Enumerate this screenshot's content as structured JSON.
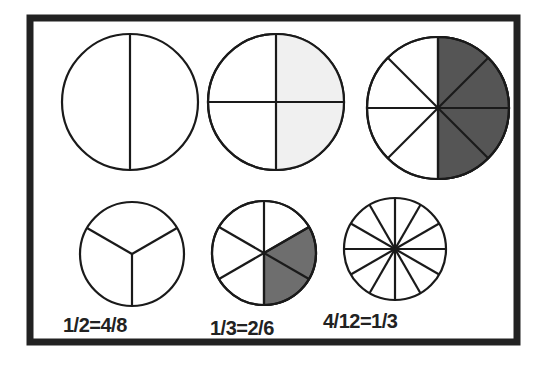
{
  "colors": {
    "frame": "#222222",
    "stroke": "#1a1a1a",
    "light_fill": "#f0f0f0",
    "dark_fill": "#555555",
    "mid_fill": "#6e6e6e"
  },
  "circles": [
    {
      "name": "halves",
      "parts": 2,
      "shaded": 0
    },
    {
      "name": "quarters",
      "parts": 4,
      "shaded": 2,
      "shade": "light"
    },
    {
      "name": "eighths",
      "parts": 8,
      "shaded": 4,
      "shade": "dark"
    },
    {
      "name": "thirds",
      "parts": 3,
      "shaded": 0
    },
    {
      "name": "sixths",
      "parts": 6,
      "shaded": 2,
      "shade": "mid"
    },
    {
      "name": "twelfths",
      "parts": 12,
      "shaded": 0
    }
  ],
  "labels": {
    "first": "1/2=4/8",
    "second": "1/3=2/6",
    "third": "4/12=1/3"
  }
}
